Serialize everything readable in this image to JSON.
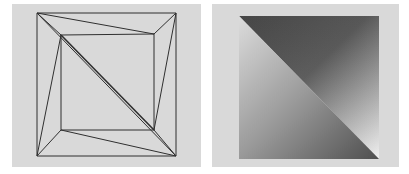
{
  "figure": {
    "panels": [
      {
        "id": "wireframe",
        "description": "Triangulated wireframe mesh: outer square with rotated inner square connected by triangles",
        "background": "#d9d9d9",
        "stroke": "#333333",
        "outer_square": [
          [
            37,
            13
          ],
          [
            176,
            13
          ],
          [
            176,
            156
          ],
          [
            37,
            156
          ]
        ],
        "inner_square": [
          [
            61,
            34
          ],
          [
            154,
            34
          ],
          [
            154,
            130
          ],
          [
            61,
            130
          ]
        ]
      },
      {
        "id": "shaded",
        "description": "Gouraud-shaded square split into two triangles along the diagonal",
        "background": "#d9d9d9",
        "square": [
          [
            239,
            16
          ],
          [
            379,
            159
          ]
        ],
        "upper_triangle_gradient": [
          "#555555",
          "#e0e0e0"
        ],
        "lower_triangle_gradient": [
          "#c8c8c8",
          "#5a5a5a"
        ]
      }
    ]
  }
}
